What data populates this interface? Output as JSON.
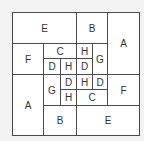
{
  "diagram": {
    "type": "tiling-puzzle",
    "origin": [
      12,
      12
    ],
    "cells": [
      {
        "label": "E",
        "x": 12,
        "y": 12,
        "w": 65,
        "h": 32
      },
      {
        "label": "B",
        "x": 76,
        "y": 12,
        "w": 32,
        "h": 32
      },
      {
        "label": "A",
        "x": 107,
        "y": 12,
        "w": 33,
        "h": 63
      },
      {
        "label": "F",
        "x": 12,
        "y": 43,
        "w": 32,
        "h": 32
      },
      {
        "label": "C",
        "x": 43,
        "y": 43,
        "w": 34,
        "h": 16
      },
      {
        "label": "H",
        "x": 76,
        "y": 43,
        "w": 17,
        "h": 16
      },
      {
        "label": "G",
        "x": 92,
        "y": 43,
        "w": 16,
        "h": 32
      },
      {
        "label": "D",
        "x": 43,
        "y": 58,
        "w": 18,
        "h": 17
      },
      {
        "label": "H",
        "x": 60,
        "y": 58,
        "w": 17,
        "h": 17
      },
      {
        "label": "D",
        "x": 76,
        "y": 58,
        "w": 17,
        "h": 17
      },
      {
        "label": "A",
        "x": 12,
        "y": 74,
        "w": 32,
        "h": 62
      },
      {
        "label": "G",
        "x": 43,
        "y": 74,
        "w": 18,
        "h": 32
      },
      {
        "label": "D",
        "x": 60,
        "y": 74,
        "w": 17,
        "h": 16
      },
      {
        "label": "H",
        "x": 76,
        "y": 74,
        "w": 17,
        "h": 16
      },
      {
        "label": "D",
        "x": 92,
        "y": 74,
        "w": 16,
        "h": 16
      },
      {
        "label": "F",
        "x": 107,
        "y": 74,
        "w": 33,
        "h": 32
      },
      {
        "label": "H",
        "x": 60,
        "y": 89,
        "w": 17,
        "h": 17
      },
      {
        "label": "C",
        "x": 76,
        "y": 89,
        "w": 32,
        "h": 17
      },
      {
        "label": "B",
        "x": 43,
        "y": 105,
        "w": 34,
        "h": 31
      },
      {
        "label": "E",
        "x": 76,
        "y": 105,
        "w": 64,
        "h": 31
      }
    ]
  }
}
